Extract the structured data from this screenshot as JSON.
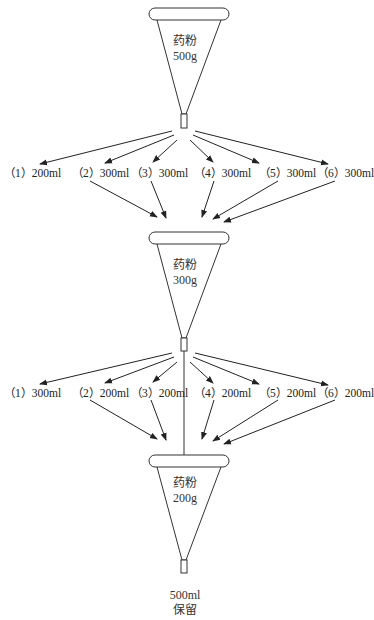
{
  "diagram": {
    "type": "multi-stage percolation / extraction flow",
    "stages": [
      {
        "funnel": {
          "line1": "药粉",
          "line2": "500g"
        },
        "fractions": [
          {
            "id": "（1）",
            "volume": "200ml"
          },
          {
            "id": "（2）",
            "volume": "300ml"
          },
          {
            "id": "（3）",
            "volume": "300ml"
          },
          {
            "id": "（4）",
            "volume": "300ml"
          },
          {
            "id": "（5）",
            "volume": "300ml"
          },
          {
            "id": "（6）",
            "volume": "300ml"
          }
        ]
      },
      {
        "funnel": {
          "line1": "药粉",
          "line2": "300g"
        },
        "fractions": [
          {
            "id": "（1）",
            "volume": "300ml"
          },
          {
            "id": "（2）",
            "volume": "200ml"
          },
          {
            "id": "（3）",
            "volume": "200ml"
          },
          {
            "id": "（4）",
            "volume": "200ml"
          },
          {
            "id": "（5）",
            "volume": "200ml"
          },
          {
            "id": "（6）",
            "volume": "200ml"
          }
        ]
      },
      {
        "funnel": {
          "line1": "药粉",
          "line2": "200g"
        }
      }
    ],
    "final_output": {
      "line1": "500ml",
      "line2": "保留"
    }
  },
  "labels": {
    "s1": [
      "（1）200ml",
      "（2）300ml",
      "（3）300ml",
      "（4）300ml",
      "（5）300ml",
      "（6）300ml"
    ],
    "s2": [
      "（1）300ml",
      "（2）200ml",
      "（3）200ml",
      "（4）200ml",
      "（5）200ml",
      "（6）200ml"
    ]
  }
}
